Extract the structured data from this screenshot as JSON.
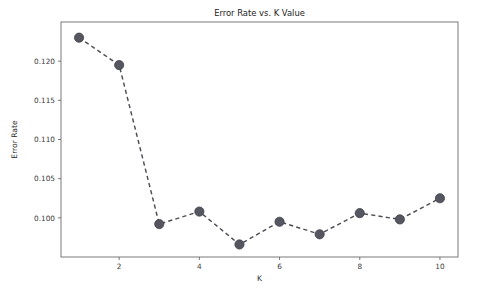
{
  "figure": {
    "background_color": "#ffffff",
    "title": "Error Rate vs. K Value",
    "axis_color": "#6b6b6b",
    "series_color": "#4d4d55",
    "marker_color": "#565660"
  },
  "chart_data": {
    "type": "line",
    "title": "Error Rate vs. K Value",
    "xlabel": "K",
    "ylabel": "Error Rate",
    "x": [
      1,
      2,
      3,
      4,
      5,
      6,
      7,
      8,
      9,
      10
    ],
    "values": [
      0.123,
      0.1195,
      0.0992,
      0.1008,
      0.0966,
      0.0995,
      0.0979,
      0.1006,
      0.0998,
      0.1025
    ],
    "series": [
      {
        "name": "Error Rate",
        "values": [
          0.123,
          0.1195,
          0.0992,
          0.1008,
          0.0966,
          0.0995,
          0.0979,
          0.1006,
          0.0998,
          0.1025
        ]
      }
    ],
    "xlim": [
      0.55,
      10.45
    ],
    "ylim": [
      0.095,
      0.125
    ],
    "xticks": [
      2,
      4,
      6,
      8,
      10
    ],
    "xtick_labels": [
      "2",
      "4",
      "6",
      "8",
      "10"
    ],
    "yticks": [
      0.1,
      0.105,
      0.11,
      0.115,
      0.12
    ],
    "ytick_labels": [
      "0.100",
      "0.105",
      "0.110",
      "0.115",
      "0.120"
    ],
    "grid": false,
    "legend": false,
    "linestyle": "dashed",
    "marker": "circle"
  }
}
